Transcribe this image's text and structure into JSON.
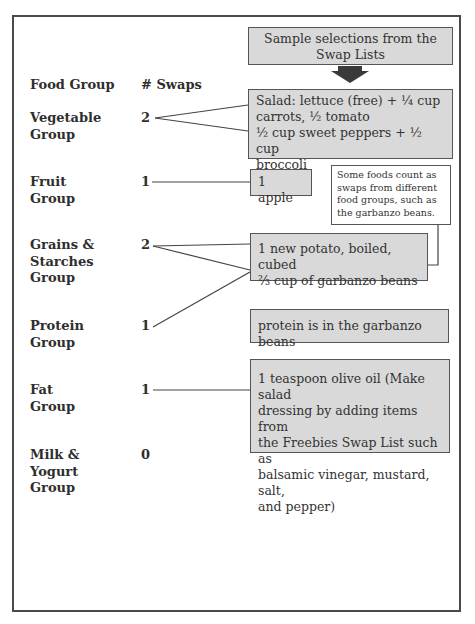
{
  "header": {
    "title_box": "Sample selections from the Swap Lists",
    "col_food_group": "Food Group",
    "col_swaps": "# Swaps"
  },
  "groups": [
    {
      "name_line1": "Vegetable",
      "name_line2": "Group",
      "name_line3": "",
      "swaps": "2"
    },
    {
      "name_line1": "Fruit",
      "name_line2": "Group",
      "name_line3": "",
      "swaps": "1"
    },
    {
      "name_line1": "Grains &",
      "name_line2": "Starches",
      "name_line3": "Group",
      "swaps": "2"
    },
    {
      "name_line1": "Protein",
      "name_line2": "Group",
      "name_line3": "",
      "swaps": "1"
    },
    {
      "name_line1": "Fat",
      "name_line2": "Group",
      "name_line3": "",
      "swaps": "1"
    },
    {
      "name_line1": "Milk &",
      "name_line2": "Yogurt",
      "name_line3": "Group",
      "swaps": "0"
    }
  ],
  "selections": {
    "vegetable": {
      "line1": "Salad: lettuce (free) + ¼ cup",
      "line2": "carrots, ½ tomato",
      "line3": "½ cup sweet peppers + ½ cup",
      "line4": "broccoli"
    },
    "fruit": {
      "line1": "1 apple"
    },
    "grains": {
      "line1": "1 new potato, boiled, cubed",
      "line2": "⅔ cup of garbanzo beans"
    },
    "protein": {
      "line1": "protein is in the garbanzo beans"
    },
    "fat": {
      "line1": "1 teaspoon olive oil (Make salad",
      "line2": "dressing by adding items from",
      "line3": "the Freebies Swap List such as",
      "line4": "balsamic vinegar, mustard, salt,",
      "line5": "and pepper)"
    }
  },
  "note": {
    "line1": "Some foods count as",
    "line2": "swaps from different",
    "line3": "food groups, such as",
    "line4": "the garbanzo beans."
  },
  "colors": {
    "box_fill": "#d9d9d9",
    "border": "#555555",
    "arrow": "#3a3a3a"
  }
}
